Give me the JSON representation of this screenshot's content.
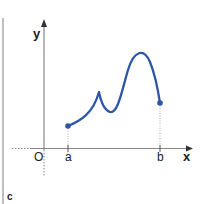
{
  "figure": {
    "panel_label": "c",
    "axes": {
      "x_label": "x",
      "y_label": "y",
      "origin_label": "O"
    },
    "points": {
      "a_label": "a",
      "b_label": "b"
    },
    "colors": {
      "curve": "#2e55a6",
      "axis": "#888888",
      "text": "#222222",
      "left_rule": "#aaaaaa"
    }
  }
}
